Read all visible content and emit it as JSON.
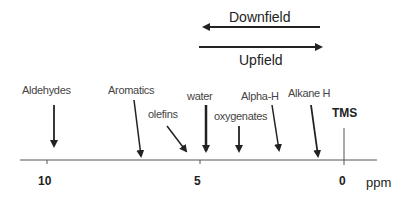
{
  "direction": {
    "downfield_label": "Downfield",
    "upfield_label": "Upfield"
  },
  "axis": {
    "unit": "ppm",
    "ticks": [
      "10",
      "5",
      "0"
    ],
    "reference_label": "TMS"
  },
  "regions": [
    {
      "label": "Aldehydes",
      "approx_ppm": 9.7
    },
    {
      "label": "Aromatics",
      "approx_ppm": 7.0
    },
    {
      "label": "olefins",
      "approx_ppm": 5.3
    },
    {
      "label": "water",
      "approx_ppm": 4.8
    },
    {
      "label": "oxygenates",
      "approx_ppm": 3.7
    },
    {
      "label": "Alpha-H",
      "approx_ppm": 2.2
    },
    {
      "label": "Alkane H",
      "approx_ppm": 0.9
    }
  ],
  "colors": {
    "line": "#333333",
    "text": "#444444",
    "background": "#ffffff"
  }
}
